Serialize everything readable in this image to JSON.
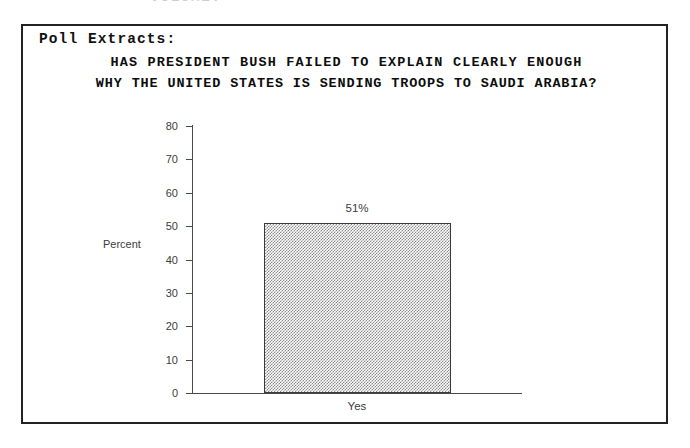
{
  "page": {
    "top_cut_text": "VOLUME:"
  },
  "panel": {
    "heading": "Poll Extracts:"
  },
  "chart_data": {
    "type": "bar",
    "title_line1": "HAS PRESIDENT BUSH FAILED TO EXPLAIN CLEARLY ENOUGH",
    "title_line2": "WHY THE UNITED STATES IS SENDING TROOPS TO SAUDI ARABIA?",
    "title": "HAS PRESIDENT BUSH FAILED TO EXPLAIN CLEARLY ENOUGH WHY THE UNITED STATES IS SENDING TROOPS TO SAUDI ARABIA?",
    "categories": [
      "Yes"
    ],
    "values": [
      51
    ],
    "data_labels": [
      "51%"
    ],
    "xlabel": "",
    "ylabel": "Percent",
    "ylim": [
      0,
      80
    ],
    "ytick_labels": [
      "0",
      "10",
      "20",
      "30",
      "40",
      "50",
      "60",
      "70",
      "80"
    ],
    "ytick_values": [
      0,
      10,
      20,
      30,
      40,
      50,
      60,
      70,
      80
    ],
    "grid": false,
    "legend": false,
    "bar_fill": "#8a8a8a",
    "bar_edge": "#3a3a3a",
    "axis_color": "#4a4a4a",
    "text_color": "#3c3c3c"
  }
}
